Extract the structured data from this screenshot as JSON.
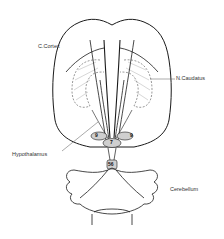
{
  "diagram": {
    "labels": {
      "cortex": "C.Cortex",
      "caudatus": "N.Caudatus",
      "hypothalamus": "Hypothalamus",
      "cerebellum": "Cerebellum"
    },
    "nuclei": {
      "left_9": "9",
      "right_9": "9",
      "center_7": "7",
      "lower_56": "56"
    },
    "colors": {
      "line": "#1a1a1a",
      "hatch": "#999999",
      "nucleus_fill": "#cfcfcf",
      "background": "#ffffff"
    }
  }
}
